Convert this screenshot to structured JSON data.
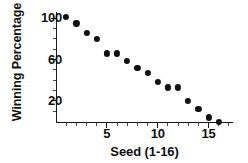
{
  "chart_data": {
    "type": "scatter",
    "title": "",
    "xlabel": "Seed (1-16)",
    "ylabel": "Winning Percentage",
    "x": [
      1,
      2,
      3,
      4,
      5,
      6,
      7,
      8,
      9,
      10,
      11,
      12,
      13,
      14,
      15,
      16
    ],
    "values": [
      101,
      95,
      86,
      80,
      66,
      66,
      59,
      52,
      47,
      38,
      33,
      33,
      20,
      12,
      4,
      0
    ],
    "series": [
      {
        "name": "Winning Percentage by Seed",
        "values": [
          101,
          95,
          86,
          80,
          66,
          66,
          59,
          52,
          47,
          38,
          33,
          33,
          20,
          12,
          4,
          0
        ]
      }
    ],
    "xlim": [
      0,
      17.4
    ],
    "ylim": [
      0,
      106
    ],
    "xticks": [
      5,
      10,
      15
    ],
    "xtick_labels": [
      "5",
      "10",
      "15"
    ],
    "xminor_ticks": [
      1,
      2,
      3,
      4,
      6,
      7,
      8,
      9,
      11,
      12,
      13,
      14,
      16,
      17
    ],
    "yticks": [
      20,
      60,
      100
    ],
    "ytick_labels": [
      "20",
      "60",
      "100"
    ],
    "yminor_ticks": [
      10,
      30,
      40,
      50,
      70,
      80,
      90
    ],
    "grid": false,
    "legend": false,
    "marker": "circle",
    "marker_color": "#111111",
    "axis_color": "#1a1a1a",
    "background": "#ffffff"
  }
}
